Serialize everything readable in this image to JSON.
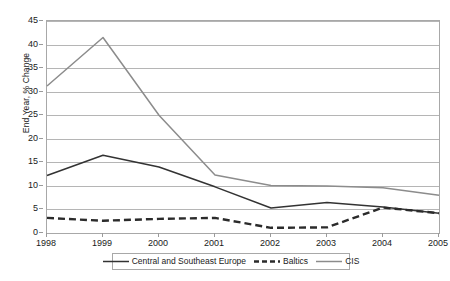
{
  "chart_data": {
    "type": "line",
    "title": "",
    "xlabel": "",
    "ylabel": "End Year, % Change",
    "categories": [
      "1998",
      "1999",
      "2000",
      "2001",
      "2002",
      "2003",
      "2004",
      "2005"
    ],
    "ylim": [
      0,
      45
    ],
    "y_ticks": [
      0,
      5,
      10,
      15,
      20,
      25,
      30,
      35,
      40,
      45
    ],
    "grid": true,
    "legend_position": "bottom",
    "series": [
      {
        "name": "Central and Southeast Europe",
        "style": "solid",
        "color": "#333333",
        "values": [
          12.2,
          16.5,
          14.0,
          9.8,
          5.3,
          6.5,
          5.5,
          4.2
        ]
      },
      {
        "name": "Baltics",
        "style": "dashed",
        "color": "#2b2b2b",
        "values": [
          3.2,
          2.6,
          3.0,
          3.2,
          1.1,
          1.2,
          5.4,
          4.2
        ]
      },
      {
        "name": "CIS",
        "style": "solid",
        "color": "#8c8c8c",
        "values": [
          31.2,
          41.5,
          25.0,
          12.3,
          10.1,
          10.0,
          9.6,
          8.0
        ]
      }
    ]
  },
  "axis": {
    "y_title": "End Year, % Change",
    "y_tick_labels": [
      "45",
      "40",
      "35",
      "30",
      "25",
      "20",
      "15",
      "10",
      "5",
      "0"
    ],
    "x_tick_labels": [
      "1998",
      "1999",
      "2000",
      "2001",
      "2002",
      "2003",
      "2004",
      "2005"
    ]
  },
  "legend": {
    "items": [
      {
        "label": "Central and Southeast Europe",
        "icon": "solid-line-swatch"
      },
      {
        "label": "Baltics",
        "icon": "dashed-line-swatch"
      },
      {
        "label": "CIS",
        "icon": "solid-gray-line-swatch"
      }
    ]
  }
}
